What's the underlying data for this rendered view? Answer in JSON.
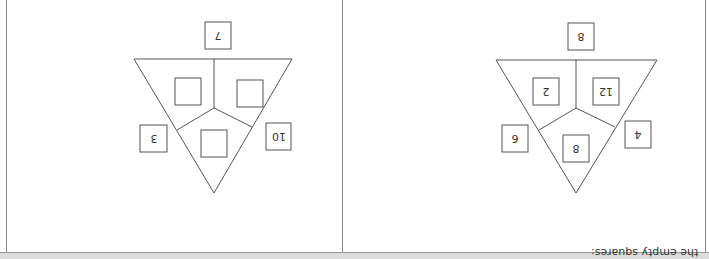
{
  "orientation": "rotated-180",
  "caption": "the empty squares:",
  "puzzles": [
    {
      "name": "example-puzzle",
      "top_value": "7",
      "left_outer_value": "3",
      "right_outer_value": "10",
      "inner": {
        "left": "",
        "right": "",
        "bottom": ""
      }
    },
    {
      "name": "solved-puzzle",
      "top_value": "8",
      "left_outer_value": "6",
      "right_outer_value": "4",
      "inner": {
        "left": "2",
        "right": "12",
        "bottom": "8"
      }
    }
  ],
  "colors": {
    "line": "#555555",
    "border": "#8a8a8a",
    "band": "#dcdcdc"
  }
}
